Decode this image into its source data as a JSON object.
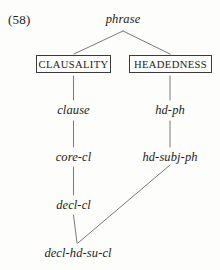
{
  "figure": {
    "example_number": "(58)",
    "kind": "type-hierarchy-tree",
    "ink_color": "#1c1c1c",
    "line_color": "#6a6a6a",
    "box_border_color": "#3b3b3b",
    "background_color": "#fdfdfb"
  },
  "nodes": {
    "root": {
      "label": "phrase",
      "style": "italic"
    },
    "dimension_left": {
      "label": "CLAUSALITY",
      "style": "boxed-caps"
    },
    "dimension_right": {
      "label": "HEADEDNESS",
      "style": "boxed-caps"
    },
    "clause": {
      "label": "clause",
      "style": "italic"
    },
    "hd_ph": {
      "label": "hd-ph",
      "style": "italic"
    },
    "core_cl": {
      "label": "core-cl",
      "style": "italic"
    },
    "hd_subj_ph": {
      "label": "hd-subj-ph",
      "style": "italic"
    },
    "decl_cl": {
      "label": "decl-cl",
      "style": "italic"
    },
    "decl_hd_su_cl": {
      "label": "decl-hd-su-cl",
      "style": "italic"
    }
  },
  "edges": [
    {
      "from": "root",
      "to": "dimension_left"
    },
    {
      "from": "root",
      "to": "dimension_right"
    },
    {
      "from": "dimension_left",
      "to": "clause"
    },
    {
      "from": "dimension_right",
      "to": "hd_ph"
    },
    {
      "from": "clause",
      "to": "core_cl"
    },
    {
      "from": "hd_ph",
      "to": "hd_subj_ph"
    },
    {
      "from": "core_cl",
      "to": "decl_cl"
    },
    {
      "from": "decl_cl",
      "to": "decl_hd_su_cl"
    },
    {
      "from": "hd_subj_ph",
      "to": "decl_hd_su_cl"
    }
  ]
}
